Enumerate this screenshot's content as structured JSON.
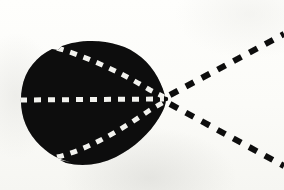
{
  "figure": {
    "title": "Scanned technical diagram: dark lobe with radiating dashed rays",
    "caption": "",
    "background_color": "#fdfdfb",
    "ink_color": "#0a0a0a",
    "highlight_color": "#f2f2ee",
    "canvas": {
      "width": 284,
      "height": 190
    }
  },
  "margin_rule": {
    "name": "left-margin-rule",
    "x": 8,
    "y_start": 0,
    "y_end": 190,
    "thickness": 2,
    "color": "#141414"
  },
  "lobe": {
    "name": "dark-lobe",
    "description": "solid black teardrop / near-circular blob with a sharp apex on the right",
    "fill": "#090909",
    "apex": {
      "x": 166,
      "y": 99
    },
    "left_extent": 21,
    "top_extent": 42,
    "bottom_extent": 164,
    "center": {
      "x": 88,
      "y": 102
    },
    "radius_x": 68,
    "radius_y": 61
  },
  "apex_point": {
    "name": "convergence-apex",
    "x": 166,
    "y": 99,
    "label": ""
  },
  "interior_rays": {
    "name": "white-dashed-rays",
    "color": "#f2f2ee",
    "dash": "7 7",
    "stroke_width": 5,
    "count": 3,
    "items": [
      {
        "name": "interior-ray-upper",
        "from": {
          "x": 57,
          "y": 48
        },
        "to": {
          "x": 164,
          "y": 97
        },
        "curved": true
      },
      {
        "name": "interior-ray-axis",
        "from": {
          "x": 20,
          "y": 100
        },
        "to": {
          "x": 164,
          "y": 99
        },
        "curved": false
      },
      {
        "name": "interior-ray-lower",
        "from": {
          "x": 57,
          "y": 157
        },
        "to": {
          "x": 164,
          "y": 102
        },
        "curved": true
      }
    ]
  },
  "exterior_rays": {
    "name": "black-dashed-rays",
    "color": "#0b0b0b",
    "dash": "9 9",
    "stroke_width": 6,
    "count": 3,
    "items": [
      {
        "name": "exterior-ray-upper",
        "from": {
          "x": 170,
          "y": 95
        },
        "to": {
          "x": 284,
          "y": 34
        },
        "angle_deg": -28
      },
      {
        "name": "exterior-ray-axis",
        "from": {
          "x": 172,
          "y": 99
        },
        "to": {
          "x": 284,
          "y": 99
        },
        "angle_deg": 0
      },
      {
        "name": "exterior-ray-lower",
        "from": {
          "x": 170,
          "y": 104
        },
        "to": {
          "x": 284,
          "y": 166
        },
        "angle_deg": 28
      }
    ]
  }
}
